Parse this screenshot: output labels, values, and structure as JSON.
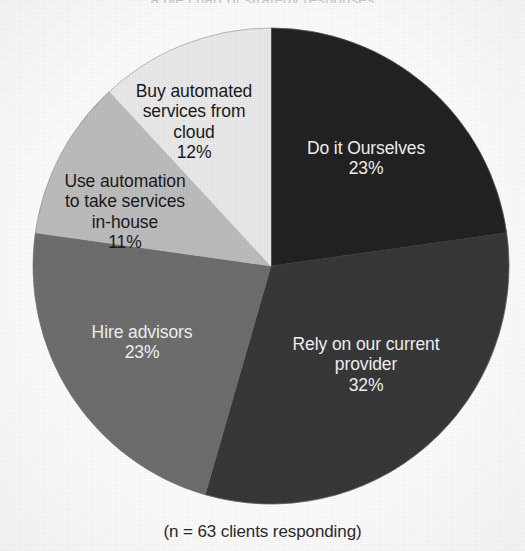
{
  "page": {
    "title_remnant": "a pie chart of strategy responses",
    "caption": "(n = 63 clients responding)",
    "background_color": "#fdfdfd"
  },
  "chart_data": {
    "type": "pie",
    "title": "",
    "subtitle": "",
    "xlabel": "",
    "ylabel": "",
    "legend_position": "none",
    "labels_inside_slices": true,
    "start_angle_degrees": 0,
    "direction": "clockwise",
    "total_percent": 101,
    "annotation": "(n = 63 clients responding)",
    "sample_size": 63,
    "categories": [
      "Do it Ourselves",
      "Rely on our current provider",
      "Hire advisors",
      "Use automation to take services in-house",
      "Buy automated services from cloud"
    ],
    "values": [
      23,
      32,
      23,
      11,
      12
    ],
    "value_labels": [
      "23%",
      "32%",
      "23%",
      "11%",
      "12%"
    ],
    "colors": [
      "#222222",
      "#383838",
      "#6e6e6e",
      "#bdbdbd",
      "#eaeaea"
    ],
    "slices": [
      {
        "label": "Do it Ourselves",
        "label_lines": [
          "Do it Ourselves"
        ],
        "value": 23,
        "value_label": "23%",
        "color": "#222222",
        "text_color": "#f2f2f2"
      },
      {
        "label": "Rely on our current provider",
        "label_lines": [
          "Rely on our current",
          "provider"
        ],
        "value": 32,
        "value_label": "32%",
        "color": "#383838",
        "text_color": "#f2f2f2"
      },
      {
        "label": "Hire advisors",
        "label_lines": [
          "Hire advisors"
        ],
        "value": 23,
        "value_label": "23%",
        "color": "#6e6e6e",
        "text_color": "#f2f2f2"
      },
      {
        "label": "Use automation to take services in-house",
        "label_lines": [
          "Use automation",
          "to take services",
          "in-house"
        ],
        "value": 11,
        "value_label": "11%",
        "color": "#bdbdbd",
        "text_color": "#1a1a1a"
      },
      {
        "label": "Buy automated services from cloud",
        "label_lines": [
          "Buy automated",
          "services from",
          "cloud"
        ],
        "value": 12,
        "value_label": "12%",
        "color": "#eaeaea",
        "text_color": "#1a1a1a"
      }
    ]
  }
}
